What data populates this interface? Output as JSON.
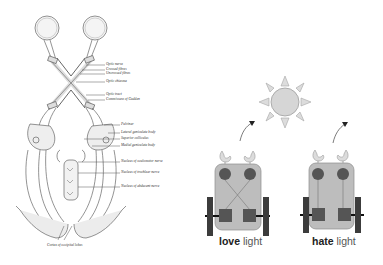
{
  "anatomy": {
    "labels": [
      {
        "text": "Optic nerve",
        "x": 106,
        "y": 64
      },
      {
        "text": "Crossed fibres",
        "x": 106,
        "y": 69
      },
      {
        "text": "Uncrossed fibres",
        "x": 106,
        "y": 73
      },
      {
        "text": "Optic chiasma",
        "x": 106,
        "y": 81
      },
      {
        "text": "Optic tract",
        "x": 106,
        "y": 94
      },
      {
        "text": "Commissure of Gudden",
        "x": 106,
        "y": 99
      },
      {
        "text": "Pulvinar",
        "x": 121,
        "y": 124
      },
      {
        "text": "Lateral geniculate body",
        "x": 121,
        "y": 132
      },
      {
        "text": "Superior colliculus",
        "x": 121,
        "y": 138
      },
      {
        "text": "Medial geniculate body",
        "x": 121,
        "y": 145
      },
      {
        "text": "Nucleus of oculomotor nerve",
        "x": 121,
        "y": 161
      },
      {
        "text": "Nucleus of trochlear nerve",
        "x": 121,
        "y": 172
      },
      {
        "text": "Nucleus of abducent nerve",
        "x": 121,
        "y": 186
      },
      {
        "text": "Cortex of occipital lobes",
        "x": 47,
        "y": 245
      }
    ]
  },
  "robots": [
    {
      "id": "love",
      "bold": "love",
      "light": "light",
      "caption_x": 219,
      "wiring": "crossed"
    },
    {
      "id": "hate",
      "bold": "hate",
      "light": "light",
      "caption_x": 312,
      "wiring": "straight"
    }
  ],
  "colors": {
    "body_fill": "#bdbdbd",
    "body_stroke": "#8a8a8a",
    "sensor": "#555555",
    "motor": "#555555",
    "wheel": "#3c3c3c",
    "sun_fill": "#d4d4d4",
    "sun_stroke": "#9a9a9a",
    "ear": "#dcdcdc"
  }
}
